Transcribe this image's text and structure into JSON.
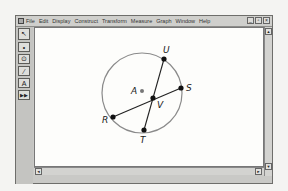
{
  "menubar": {
    "items": [
      "File",
      "Edit",
      "Display",
      "Construct",
      "Transform",
      "Measure",
      "Graph",
      "Window",
      "Help"
    ],
    "window_controls": [
      "_",
      "▫",
      "×"
    ]
  },
  "toolbar": {
    "tools": [
      {
        "name": "selection-arrow-tool",
        "glyph": "↖"
      },
      {
        "name": "point-tool",
        "glyph": "•"
      },
      {
        "name": "compass-tool",
        "glyph": "⊙"
      },
      {
        "name": "straightedge-tool",
        "glyph": "⁄"
      },
      {
        "name": "text-tool",
        "glyph": "A"
      },
      {
        "name": "custom-tool",
        "glyph": "▶▶"
      }
    ]
  },
  "figure": {
    "circle": {
      "center_label": "A",
      "cx": 142,
      "cy": 93,
      "r": 40
    },
    "points": [
      {
        "label": "U",
        "x": 164,
        "y": 59
      },
      {
        "label": "S",
        "x": 181,
        "y": 88
      },
      {
        "label": "R",
        "x": 113,
        "y": 117
      },
      {
        "label": "T",
        "x": 144,
        "y": 130
      },
      {
        "label": "V",
        "x": 153,
        "y": 98
      }
    ],
    "chords": [
      [
        "U",
        "T"
      ],
      [
        "R",
        "S"
      ]
    ],
    "colors": {
      "circle": "#8a8a8a",
      "chord": "#222222",
      "point": "#111111",
      "center": "#777777"
    }
  },
  "scrollbars": {
    "up": "▲",
    "down": "▼",
    "left": "◄",
    "right": "►"
  }
}
